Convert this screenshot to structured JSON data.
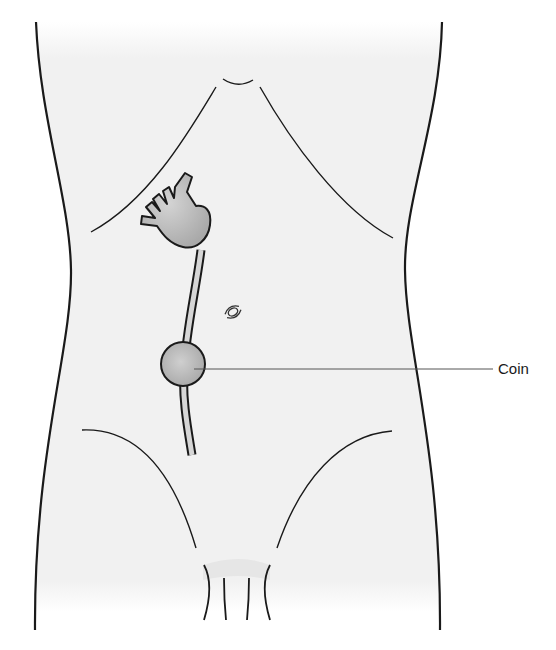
{
  "diagram": {
    "labels": [
      {
        "id": "coin-label",
        "text": "Coin"
      }
    ],
    "colors": {
      "outline": "#1a1a1a",
      "body_fill": "#f2f2f2",
      "organ_fill": "#b9b9b9",
      "tube_fill": "#d9d9d9",
      "leader_line": "#555555"
    }
  }
}
